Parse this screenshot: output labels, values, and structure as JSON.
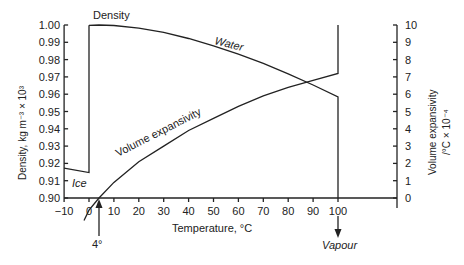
{
  "chart_data": {
    "type": "line",
    "title": "",
    "xlabel": "Temperature, °C",
    "ylabel": "Density, kg m⁻³ × 10³",
    "y2label_line1": "Volume expansivity",
    "y2label_line2": "/°C × 10⁻⁴",
    "xlim": [
      -10,
      115
    ],
    "ylim": [
      0.9,
      1.0
    ],
    "y2lim": [
      0,
      10
    ],
    "grid": false,
    "x_ticks": [
      -10,
      0,
      10,
      20,
      30,
      40,
      50,
      60,
      70,
      80,
      90,
      100
    ],
    "y_ticks": [
      "0.90",
      "0.91",
      "0.92",
      "0.93",
      "0.94",
      "0.95",
      "0.96",
      "0.97",
      "0.98",
      "0.99",
      "1.00"
    ],
    "y2_ticks": [
      0,
      1,
      2,
      3,
      4,
      5,
      6,
      7,
      8,
      9,
      10
    ],
    "series": [
      {
        "name": "Ice",
        "axis": "left",
        "x": [
          -10,
          0
        ],
        "values": [
          0.9172,
          0.9147
        ]
      },
      {
        "name": "Density (Water)",
        "axis": "left",
        "x": [
          0,
          4,
          10,
          20,
          30,
          40,
          50,
          60,
          70,
          80,
          90,
          100
        ],
        "values": [
          0.9998,
          1.0,
          0.9997,
          0.9982,
          0.9957,
          0.9922,
          0.988,
          0.9832,
          0.9778,
          0.9718,
          0.9653,
          0.9584
        ]
      },
      {
        "name": "Volume expansivity",
        "axis": "right",
        "x": [
          -2,
          0,
          4,
          10,
          20,
          30,
          40,
          50,
          60,
          70,
          80,
          90,
          100
        ],
        "values": [
          -1.3,
          -0.7,
          0.0,
          0.9,
          2.1,
          3.0,
          3.9,
          4.6,
          5.3,
          5.9,
          6.4,
          6.8,
          7.2
        ]
      }
    ],
    "annotations": [
      {
        "text": "Density",
        "x": 3,
        "y": 1.003
      },
      {
        "text": "Water",
        "x": 50,
        "y": 0.99
      },
      {
        "text": "Volume expansivity",
        "x": 30,
        "y2": 4.3
      },
      {
        "text": "Ice",
        "x": -7,
        "y": 0.906
      },
      {
        "text": "4°",
        "x": 4,
        "note": "arrow pointing up to x-axis"
      },
      {
        "text": "Vapour",
        "x": 100,
        "note": "arrow pointing down from x-axis"
      }
    ],
    "phase_transitions": {
      "melting_jump_x": 0,
      "boiling_x": 100,
      "density_drop_at_100": 0.9,
      "expansivity_jump_at_100": 10
    }
  },
  "labels": {
    "density_label": "Density",
    "water_label": "Water",
    "expansivity_label": "Volume expansivity",
    "ice_label": "Ice",
    "four_deg_label": "4°",
    "vapour_label": "Vapour",
    "xlabel": "Temperature, °C",
    "ylabel": "Density, kg m⁻³ × 10³",
    "y2label_line1": "Volume expansivity",
    "y2label_line2": "/°C × 10⁻⁴"
  }
}
